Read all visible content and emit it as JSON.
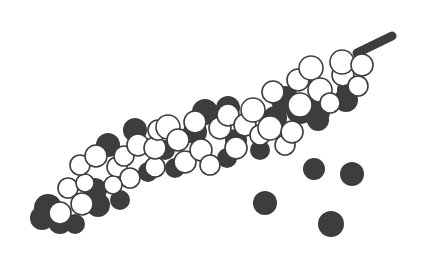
{
  "figure": {
    "width": 431,
    "height": 259,
    "colors": {
      "background": "#ffffff",
      "dark": "#3d3d3d",
      "light": "#ffffff",
      "outline": "#3d3d3d"
    }
  },
  "stem": {
    "x1": 357,
    "y1": 53,
    "x2": 392,
    "y2": 36,
    "width": 9
  },
  "spike_dark_mass": [
    [
      48,
      208,
      14
    ],
    [
      42,
      218,
      12
    ],
    [
      60,
      222,
      12
    ],
    [
      75,
      224,
      10
    ],
    [
      95,
      190,
      12
    ],
    [
      98,
      205,
      12
    ],
    [
      120,
      200,
      10
    ],
    [
      108,
      145,
      12
    ],
    [
      135,
      130,
      12
    ],
    [
      148,
      172,
      10
    ],
    [
      165,
      150,
      10
    ],
    [
      175,
      168,
      10
    ],
    [
      205,
      112,
      13
    ],
    [
      228,
      108,
      12
    ],
    [
      236,
      140,
      11
    ],
    [
      227,
      158,
      10
    ],
    [
      275,
      118,
      12
    ],
    [
      285,
      100,
      14
    ],
    [
      300,
      110,
      14
    ],
    [
      310,
      72,
      11
    ],
    [
      318,
      120,
      11
    ],
    [
      316,
      112,
      14
    ],
    [
      346,
      100,
      12
    ],
    [
      348,
      90,
      11
    ],
    [
      260,
      150,
      10
    ],
    [
      195,
      132,
      12
    ]
  ],
  "spike_light_berries": [
    [
      60,
      213,
      11
    ],
    [
      68,
      188,
      10
    ],
    [
      82,
      204,
      11
    ],
    [
      85,
      183,
      9
    ],
    [
      80,
      165,
      10
    ],
    [
      96,
      156,
      11
    ],
    [
      117,
      167,
      10
    ],
    [
      124,
      156,
      10
    ],
    [
      130,
      178,
      10
    ],
    [
      113,
      185,
      9
    ],
    [
      138,
      145,
      11
    ],
    [
      155,
      167,
      10
    ],
    [
      155,
      148,
      11
    ],
    [
      158,
      130,
      10
    ],
    [
      168,
      127,
      12
    ],
    [
      178,
      140,
      11
    ],
    [
      185,
      162,
      11
    ],
    [
      195,
      122,
      11
    ],
    [
      201,
      150,
      11
    ],
    [
      210,
      165,
      10
    ],
    [
      220,
      128,
      11
    ],
    [
      236,
      148,
      11
    ],
    [
      228,
      115,
      11
    ],
    [
      245,
      125,
      11
    ],
    [
      253,
      110,
      12
    ],
    [
      260,
      135,
      10
    ],
    [
      270,
      128,
      12
    ],
    [
      273,
      92,
      11
    ],
    [
      285,
      145,
      10
    ],
    [
      292,
      132,
      11
    ],
    [
      298,
      80,
      11
    ],
    [
      300,
      105,
      12
    ],
    [
      311,
      68,
      12
    ],
    [
      320,
      90,
      12
    ],
    [
      330,
      103,
      10
    ],
    [
      343,
      75,
      11
    ],
    [
      342,
      62,
      12
    ],
    [
      358,
      86,
      10
    ],
    [
      362,
      65,
      11
    ]
  ],
  "loose_peppercorns": [
    [
      314,
      169,
      11
    ],
    [
      352,
      174,
      12
    ],
    [
      265,
      203,
      12
    ],
    [
      331,
      224,
      13
    ]
  ]
}
